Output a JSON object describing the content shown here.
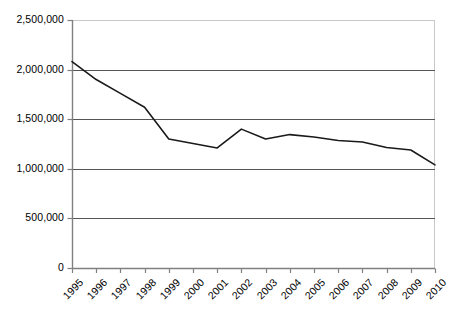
{
  "chart_data": {
    "type": "line",
    "title": "",
    "xlabel": "",
    "ylabel": "",
    "categories": [
      "1995",
      "1996",
      "1997",
      "1998",
      "1999",
      "2000",
      "2001",
      "2002",
      "2003",
      "2004",
      "2005",
      "2006",
      "2007",
      "2008",
      "2009",
      "2010"
    ],
    "values": [
      2080000,
      1900000,
      1760000,
      1620000,
      1300000,
      1255000,
      1210000,
      1400000,
      1300000,
      1345000,
      1320000,
      1285000,
      1270000,
      1215000,
      1190000,
      1040000
    ],
    "series": [
      {
        "name": "series-1",
        "values": [
          2080000,
          1900000,
          1760000,
          1620000,
          1300000,
          1255000,
          1210000,
          1400000,
          1300000,
          1345000,
          1320000,
          1285000,
          1270000,
          1215000,
          1190000,
          1040000
        ]
      }
    ],
    "ylim": [
      0,
      2500000
    ],
    "yticks": [
      0,
      500000,
      1000000,
      1500000,
      2000000,
      2500000
    ],
    "ytick_labels": [
      "0",
      "500,000",
      "1,000,000",
      "1,500,000",
      "2,000,000",
      "2,500,000"
    ],
    "grid": true,
    "legend": "none",
    "line_color": "#1a1a1a",
    "grid_color": "#555555",
    "frame_color": "#c8c8c8",
    "axis_color": "#808080",
    "background": "#ffffff"
  }
}
